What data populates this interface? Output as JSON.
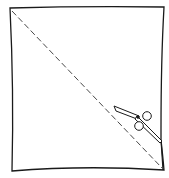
{
  "diagram": {
    "colors": {
      "stroke": "#1a1a1a",
      "background": "#ffffff"
    },
    "elements": [
      "paper-square",
      "dashed-diagonal",
      "scissors",
      "cut-flap"
    ]
  }
}
